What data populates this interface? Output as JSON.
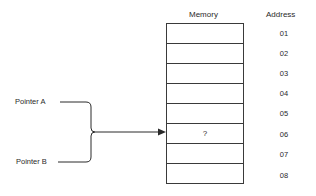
{
  "diagram": {
    "memory_header": "Memory",
    "address_header": "Address",
    "cells": [
      {
        "address": "01",
        "content": ""
      },
      {
        "address": "02",
        "content": ""
      },
      {
        "address": "03",
        "content": ""
      },
      {
        "address": "04",
        "content": ""
      },
      {
        "address": "05",
        "content": ""
      },
      {
        "address": "06",
        "content": "?"
      },
      {
        "address": "07",
        "content": ""
      },
      {
        "address": "08",
        "content": ""
      }
    ],
    "pointers": [
      {
        "label": "Pointer A"
      },
      {
        "label": "Pointer B"
      }
    ],
    "pointer_target_address": "06",
    "colors": {
      "line": "#2a2a2a",
      "background": "#ffffff"
    }
  }
}
